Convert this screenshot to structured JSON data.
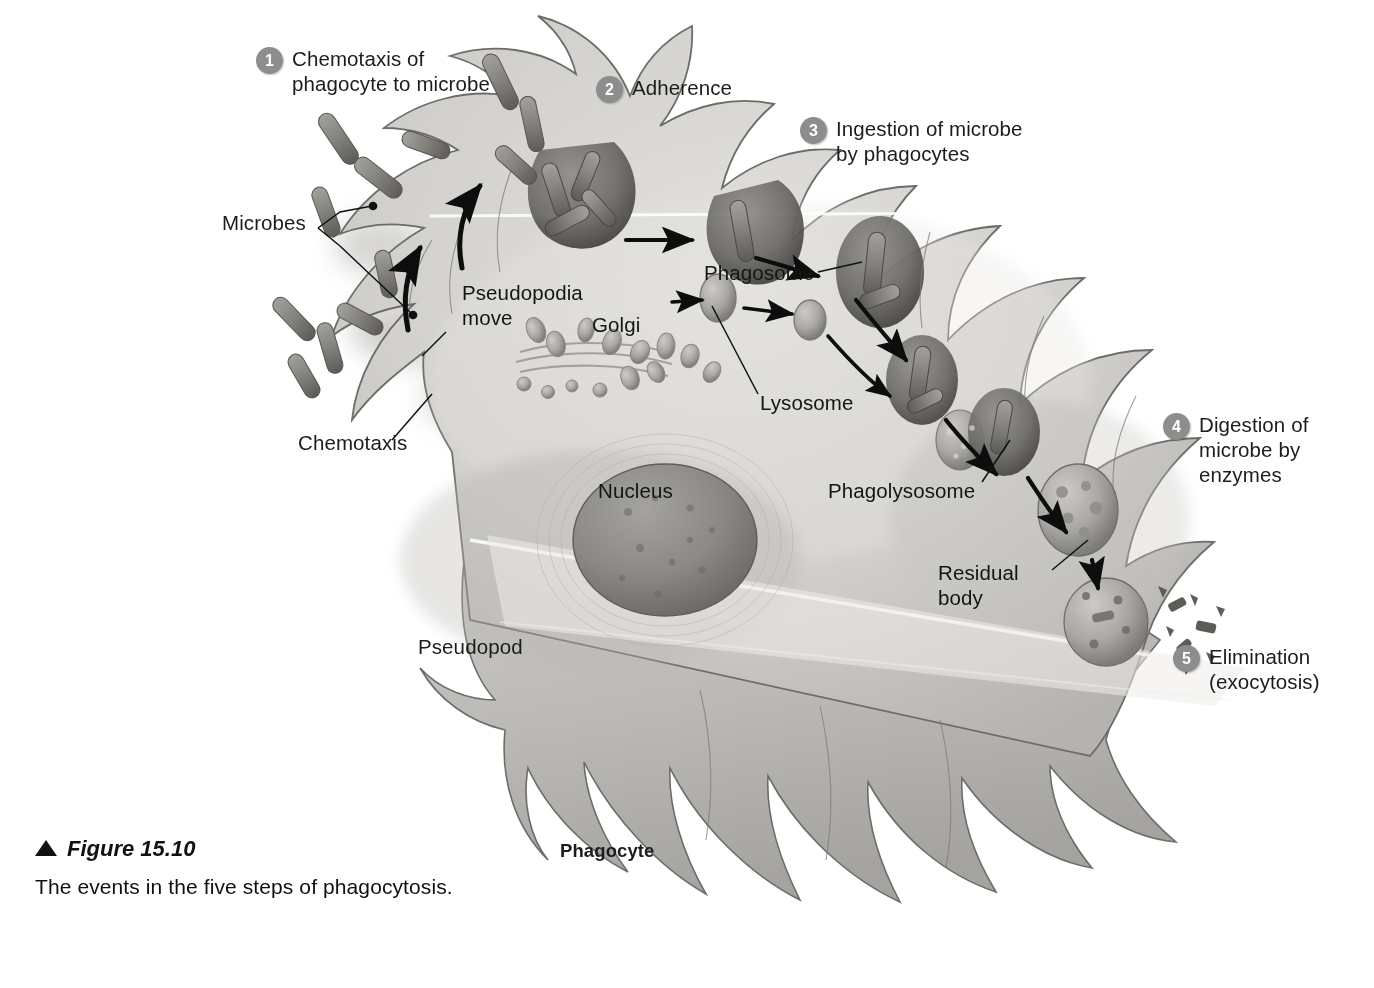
{
  "figure": {
    "title": "Figure 15.10",
    "subtitle": "The events in the five steps of phagocytosis.",
    "triangle_icon": "up-triangle-icon"
  },
  "steps": [
    {
      "number": "1",
      "label": "Chemotaxis of\nphagocyte to microbe"
    },
    {
      "number": "2",
      "label": "Adherence"
    },
    {
      "number": "3",
      "label": "Ingestion of microbe\nby phagocytes"
    },
    {
      "number": "4",
      "label": "Digestion of\nmicrobe by\nenzymes"
    },
    {
      "number": "5",
      "label": "Elimination\n(exocytosis)"
    }
  ],
  "labels": {
    "microbes": "Microbes",
    "chemotaxis": "Chemotaxis",
    "pseudopodia_move": "Pseudopodia\nmove",
    "golgi": "Golgi",
    "phagosome": "Phagosome",
    "lysosome": "Lysosome",
    "nucleus": "Nucleus",
    "phagolysosome": "Phagolysosome",
    "residual_body": "Residual\nbody",
    "pseudopod": "Pseudopod",
    "phagocyte": "Phagocyte"
  },
  "colors": {
    "badge_fill": "#8d8d8d",
    "badge_text": "#ffffff",
    "text": "#1c1c1c",
    "cytoplasm_light": "#d9d7d4",
    "cytoplasm_mid": "#c3c1bd",
    "cytoplasm_shadow": "#a8a6a2",
    "membrane_outline": "#6e6c69",
    "nucleus_fill": "#8c8a86",
    "nucleus_dark": "#6f6d69",
    "microbe_fill": "#8a8885",
    "microbe_dark": "#5f5d5a",
    "arrow": "#0d0d0d",
    "background": "#ffffff"
  },
  "illustration": {
    "type": "phagocytosis-diagram",
    "description": "Grayscale airbrush illustration of a phagocyte with many finger-like pseudopodia engulfing rod-shaped microbes; internal pathway shows phagosome fusing with lysosomes from the Golgi to form a phagolysosome, then a residual body expelled as debris.",
    "microbe_count_free": 12,
    "pathway": [
      "adherence",
      "phagosome",
      "phagolysosome",
      "residual body",
      "exocytosis"
    ]
  }
}
